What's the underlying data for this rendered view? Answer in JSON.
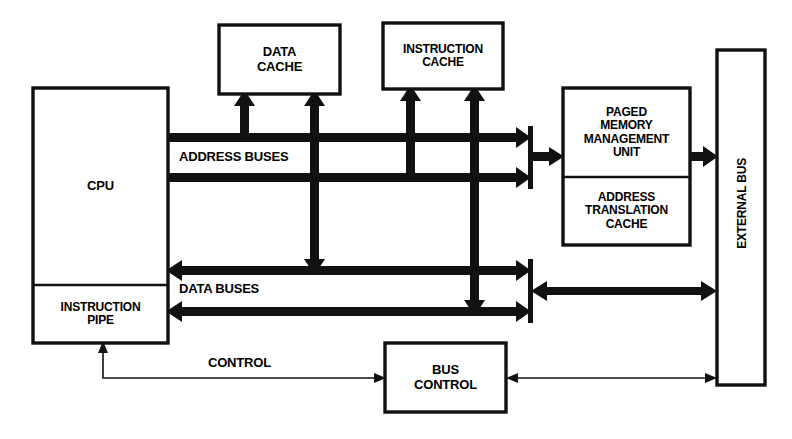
{
  "diagram": {
    "stroke_color": "#111111",
    "fill_color": "#ffffff",
    "blocks": [
      {
        "id": "cpu",
        "label": "CPU",
        "x": 33,
        "y": 88,
        "w": 135,
        "h": 255,
        "font_size": 13
      },
      {
        "id": "instruction-pipe",
        "label": "INSTRUCTION\nPIPE",
        "x": 33,
        "y": 285,
        "w": 135,
        "h": 58,
        "font_size": 12
      },
      {
        "id": "data-cache",
        "label": "DATA\nCACHE",
        "x": 219,
        "y": 25,
        "w": 121,
        "h": 69,
        "font_size": 13
      },
      {
        "id": "instruction-cache",
        "label": "INSTRUCTION\nCACHE",
        "x": 383,
        "y": 23,
        "w": 120,
        "h": 66,
        "font_size": 12
      },
      {
        "id": "paged-memory-management-unit",
        "label": "PAGED\nMEMORY\nMANAGEMENT\nUNIT",
        "x": 563,
        "y": 88,
        "w": 127,
        "h": 89,
        "font_size": 12
      },
      {
        "id": "address-translation-cache",
        "label": "ADDRESS\nTRANSLATION\nCACHE",
        "x": 563,
        "y": 177,
        "w": 127,
        "h": 68,
        "font_size": 12
      },
      {
        "id": "bus-control",
        "label": "BUS\nCONTROL",
        "x": 385,
        "y": 343,
        "w": 121,
        "h": 69,
        "font_size": 13
      },
      {
        "id": "external-bus",
        "label": "EXTERNAL BUS",
        "x": 717,
        "y": 50,
        "w": 48,
        "h": 335,
        "font_size": 12
      }
    ],
    "bus_labels": [
      {
        "id": "address-buses",
        "text": "ADDRESS BUSES",
        "x": 176,
        "y": 149,
        "font_size": 13
      },
      {
        "id": "data-buses",
        "text": "DATA BUSES",
        "x": 176,
        "y": 281,
        "font_size": 13
      },
      {
        "id": "control",
        "text": "CONTROL",
        "x": 205,
        "y": 355,
        "font_size": 13
      }
    ]
  }
}
